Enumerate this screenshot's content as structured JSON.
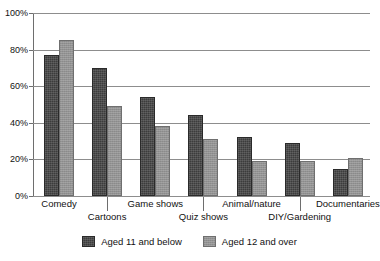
{
  "chart_data": {
    "type": "bar",
    "title": "",
    "xlabel": "",
    "ylabel": "",
    "ylim": [
      0,
      100
    ],
    "ytick_labels": [
      "0%",
      "20%",
      "40%",
      "60%",
      "80%",
      "100%"
    ],
    "ytick_values": [
      0,
      20,
      40,
      60,
      80,
      100
    ],
    "grid": true,
    "grid_axis": "y",
    "legend_position": "bottom-center",
    "categories": [
      "Comedy",
      "Cartoons",
      "Game shows",
      "Quiz shows",
      "Animal/nature",
      "DIY/Gardening",
      "Documentaries"
    ],
    "series": [
      {
        "name": "Aged 11 and below",
        "color": "#3c3c3c",
        "values": [
          77,
          70,
          54,
          44,
          32,
          29,
          15
        ]
      },
      {
        "name": "Aged 12 and over",
        "color": "#939393",
        "values": [
          85,
          49,
          38,
          31,
          19,
          19,
          21
        ]
      }
    ]
  },
  "axis": {
    "y_ticks": [
      {
        "label": "100%",
        "value": 100
      },
      {
        "label": "80%",
        "value": 80
      },
      {
        "label": "60%",
        "value": 60
      },
      {
        "label": "40%",
        "value": 40
      },
      {
        "label": "20%",
        "value": 20
      },
      {
        "label": "0%",
        "value": 0
      }
    ]
  },
  "legend": {
    "items": [
      {
        "label": "Aged 11 and below",
        "color": "#3c3c3c"
      },
      {
        "label": "Aged 12 and over",
        "color": "#939393"
      }
    ]
  },
  "colors": {
    "series_dark": "#3c3c3c",
    "series_light": "#939393",
    "gridline": "#8d8d8d",
    "axis": "#6e6e6e",
    "background": "#ffffff",
    "text": "#111111"
  }
}
